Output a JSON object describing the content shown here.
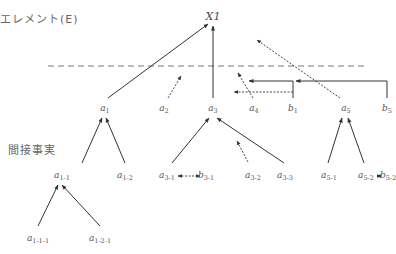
{
  "labels": {
    "element_heading": "エレメント(E)",
    "indirect_facts_heading": "間接事実"
  },
  "root": {
    "id": "X1",
    "text": "X1",
    "x": 213,
    "y": 11
  },
  "divider": {
    "style": "dashed",
    "y": 66,
    "x1": 48,
    "x2": 364,
    "color": "#777777"
  },
  "nodes": [
    {
      "id": "a1",
      "base": "a",
      "sub": "1",
      "x": 105,
      "y": 104
    },
    {
      "id": "a2",
      "base": "a",
      "sub": "2",
      "x": 164,
      "y": 104
    },
    {
      "id": "a3",
      "base": "a",
      "sub": "3",
      "x": 213,
      "y": 104
    },
    {
      "id": "a4",
      "base": "a",
      "sub": "4",
      "x": 254,
      "y": 104
    },
    {
      "id": "b1",
      "base": "b",
      "sub": "1",
      "x": 293,
      "y": 104
    },
    {
      "id": "a5",
      "base": "a",
      "sub": "5",
      "x": 346,
      "y": 104
    },
    {
      "id": "b5",
      "base": "b",
      "sub": "5",
      "x": 387,
      "y": 104
    },
    {
      "id": "a1-1",
      "base": "a",
      "sub": "1-1",
      "x": 62,
      "y": 171
    },
    {
      "id": "a1-2",
      "base": "a",
      "sub": "1-2",
      "x": 125,
      "y": 171
    },
    {
      "id": "a3-1",
      "base": "a",
      "sub": "3-1",
      "x": 167,
      "y": 171
    },
    {
      "id": "b3-1",
      "base": "b",
      "sub": "3-1",
      "x": 206,
      "y": 171
    },
    {
      "id": "a3-2",
      "base": "a",
      "sub": "3-2",
      "x": 253,
      "y": 171
    },
    {
      "id": "a3-3",
      "base": "a",
      "sub": "3-3",
      "x": 285,
      "y": 171
    },
    {
      "id": "a5-1",
      "base": "a",
      "sub": "5-1",
      "x": 329,
      "y": 171
    },
    {
      "id": "a5-2",
      "base": "a",
      "sub": "5-2",
      "x": 366,
      "y": 171
    },
    {
      "id": "b5-2",
      "base": "b",
      "sub": "5-2",
      "x": 388,
      "y": 171
    },
    {
      "id": "a1-1-1",
      "base": "a",
      "sub": "1-1-1",
      "x": 38,
      "y": 234
    },
    {
      "id": "a1-2-1",
      "base": "a",
      "sub": "1-2-1",
      "x": 100,
      "y": 234
    }
  ],
  "edges": [
    {
      "from": "a1",
      "to": "X1",
      "style": "solid",
      "head": "end",
      "pts": [
        [
          108,
          98
        ],
        [
          208,
          24
        ]
      ]
    },
    {
      "from": "a3",
      "to": "X1",
      "style": "solid",
      "head": "end",
      "pts": [
        [
          213,
          98
        ],
        [
          213,
          26
        ]
      ]
    },
    {
      "from": "a2",
      "to": "above-line",
      "style": "dotted",
      "head": "end",
      "pts": [
        [
          168,
          98
        ],
        [
          181,
          76
        ]
      ]
    },
    {
      "from": "a4",
      "to": "above-line",
      "style": "dotted",
      "head": "end",
      "pts": [
        [
          253,
          98
        ],
        [
          238,
          73
        ]
      ]
    },
    {
      "from": "a5",
      "to": "above-line",
      "style": "dotted",
      "head": "end",
      "pts": [
        [
          340,
          98
        ],
        [
          257,
          40
        ]
      ]
    },
    {
      "from": "b1",
      "to": "a4",
      "style": "solid",
      "head": "end",
      "pts": [
        [
          293,
          98
        ],
        [
          293,
          81
        ],
        [
          249,
          81
        ]
      ]
    },
    {
      "from": "b1",
      "to": "a4",
      "style": "dotted",
      "head": "end",
      "pts": [
        [
          293,
          92
        ],
        [
          234,
          92
        ]
      ]
    },
    {
      "from": "b5",
      "to": "b1",
      "style": "solid",
      "head": "end",
      "pts": [
        [
          387,
          98
        ],
        [
          387,
          81
        ],
        [
          296,
          81
        ]
      ]
    },
    {
      "from": "a1-1",
      "to": "a1",
      "style": "solid",
      "head": "end",
      "pts": [
        [
          82,
          163
        ],
        [
          102,
          118
        ]
      ]
    },
    {
      "from": "a1-2",
      "to": "a1",
      "style": "solid",
      "head": "end",
      "pts": [
        [
          125,
          163
        ],
        [
          106,
          118
        ]
      ]
    },
    {
      "from": "a3-1",
      "to": "a3",
      "style": "solid",
      "head": "end",
      "pts": [
        [
          172,
          163
        ],
        [
          209,
          118
        ]
      ]
    },
    {
      "from": "a3-3",
      "to": "a3",
      "style": "solid",
      "head": "end",
      "pts": [
        [
          284,
          163
        ],
        [
          217,
          118
        ]
      ]
    },
    {
      "from": "a3-2",
      "to": "above",
      "style": "dotted",
      "head": "end",
      "pts": [
        [
          248,
          162
        ],
        [
          237,
          141
        ]
      ]
    },
    {
      "from": "a5-1",
      "to": "a5",
      "style": "solid",
      "head": "end",
      "pts": [
        [
          328,
          163
        ],
        [
          342,
          118
        ]
      ]
    },
    {
      "from": "a5-2",
      "to": "a5",
      "style": "solid",
      "head": "end",
      "pts": [
        [
          364,
          163
        ],
        [
          348,
          118
        ]
      ]
    },
    {
      "from": "a3-1",
      "to": "b3-1",
      "style": "dotted",
      "head": "both",
      "pts": [
        [
          178,
          176
        ],
        [
          200,
          176
        ]
      ]
    },
    {
      "from": "a5-2",
      "to": "b5-2",
      "style": "dotted",
      "head": "both",
      "pts": [
        [
          377,
          176
        ],
        [
          381,
          176
        ]
      ]
    },
    {
      "from": "a1-1-1",
      "to": "a1-1",
      "style": "solid",
      "head": "end",
      "pts": [
        [
          38,
          226
        ],
        [
          58,
          185
        ]
      ]
    },
    {
      "from": "a1-2-1",
      "to": "a1-1",
      "style": "solid",
      "head": "end",
      "pts": [
        [
          100,
          226
        ],
        [
          62,
          185
        ]
      ]
    }
  ],
  "colors": {
    "line": "#333333",
    "text": "#555555",
    "background": "#ffffff"
  }
}
